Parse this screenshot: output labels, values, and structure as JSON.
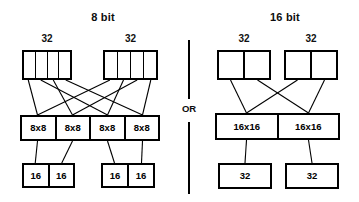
{
  "diagram": {
    "title_left": "8 bit",
    "title_right": "16 bit",
    "divider_label": "OR"
  },
  "left_panel": {
    "title": "8 bit",
    "top_labels": [
      "32",
      "32"
    ],
    "top_registers": [
      {
        "label": "32",
        "cells": [
          "",
          "",
          "",
          ""
        ]
      },
      {
        "label": "32",
        "cells": [
          "",
          "",
          "",
          ""
        ]
      }
    ],
    "middle_row": {
      "cells": [
        "8x8",
        "8x8",
        "8x8",
        "8x8"
      ]
    },
    "bottom_groups": [
      {
        "cells": [
          "16",
          "16"
        ]
      },
      {
        "cells": [
          "16",
          "16"
        ]
      }
    ]
  },
  "right_panel": {
    "title": "16 bit",
    "top_labels": [
      "32",
      "32"
    ],
    "top_registers": [
      {
        "label": "32",
        "cells": [
          "",
          ""
        ]
      },
      {
        "label": "32",
        "cells": [
          "",
          ""
        ]
      }
    ],
    "middle_row": {
      "cells": [
        "16x16",
        "16x16"
      ]
    },
    "bottom_groups": [
      {
        "cells": [
          "32"
        ]
      },
      {
        "cells": [
          "32"
        ]
      }
    ]
  },
  "colors": {
    "stroke": "#000000",
    "background": "#ffffff",
    "text": "#0d0d0d"
  }
}
